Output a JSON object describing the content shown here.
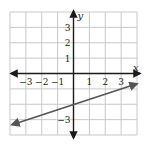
{
  "chart_data": {
    "type": "line",
    "title": "",
    "xlabel": "x",
    "ylabel": "y",
    "xlim": [
      -4,
      4
    ],
    "ylim": [
      -4,
      4
    ],
    "grid": true,
    "x_tick_labels": [
      "−3",
      "−2",
      "−1",
      "1",
      "2",
      "3"
    ],
    "x_ticks": [
      -3,
      -2,
      -1,
      1,
      2,
      3
    ],
    "y_tick_labels": [
      "3",
      "2",
      "1",
      "−3"
    ],
    "y_ticks": [
      3,
      2,
      1,
      -3
    ],
    "series": [
      {
        "name": "line",
        "equation": "y = (1/3)x − 2",
        "x": [
          -4,
          0,
          3,
          4
        ],
        "y": [
          -3.33,
          -2,
          -1,
          -0.67
        ],
        "arrows": "both"
      }
    ]
  },
  "colors": {
    "grid": "#c8c8c8",
    "axes": "#1a1a1a",
    "line": "#555555",
    "text": "#222222"
  }
}
